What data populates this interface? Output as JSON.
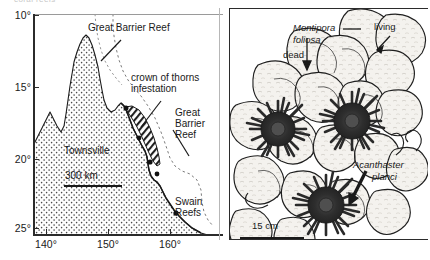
{
  "figure": {
    "clipped_top_text": "coral reefs",
    "panels": [
      "map-great-barrier-reef",
      "coral-illustration"
    ]
  },
  "map": {
    "title": "",
    "y_axis": {
      "ticks": [
        "10°",
        "15°",
        "20°",
        "25°"
      ],
      "unit": "degrees south latitude"
    },
    "x_axis": {
      "ticks": [
        "140°",
        "150°",
        "160°"
      ],
      "unit": "degrees east longitude"
    },
    "labels": {
      "great_barrier_reef_top": "Great Barrier Reef",
      "crown_of_thorns": "crown of thorns\ninfestation",
      "crown_of_thorns_line1": "crown of thorns",
      "crown_of_thorns_line2": "infestation",
      "great_barrier_reef_right_line1": "Great",
      "great_barrier_reef_right_line2": "Barrier",
      "great_barrier_reef_right_line3": "Reef",
      "swain_reefs_line1": "Swain",
      "swain_reefs_line2": "Reefs",
      "townsville": "Townsville"
    },
    "scale_bar": {
      "label": "300 km",
      "length_px": 58
    },
    "colors": {
      "land_stipple": "#3a3a3a",
      "infestation_hatch": "#1a1a1a",
      "coastline": "#1a1a1a",
      "reef_dashed": "#6f6f6f",
      "axis": "#2b2b2b"
    }
  },
  "coral": {
    "labels": {
      "montipora_line1": "Montipora",
      "montipora_line2": "foliosa",
      "living": "living",
      "dead": "dead",
      "acanthaster_line1": "Acanthaster",
      "acanthaster_line2": "planci"
    },
    "scale_bar": {
      "label": "15 cm",
      "length_px": 64
    },
    "colors": {
      "coral_fill": "#f2f0ec",
      "coral_outline": "#1f1f1f",
      "starfish": "#2a2a2a",
      "frame": "#2b2b2b"
    }
  }
}
